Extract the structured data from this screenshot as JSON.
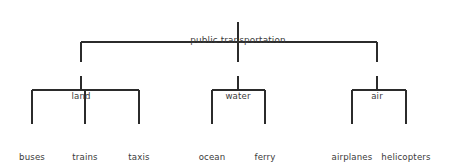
{
  "diagram": {
    "type": "tree",
    "title": "public transportation",
    "background_color": "#ffffff",
    "line_color": "#2b2b2b",
    "text_color": "#3a3a3a",
    "root": {
      "id": "public-transportation",
      "label": "public transportation",
      "x": 238,
      "y": 14
    },
    "level1": [
      {
        "id": "land",
        "label": "land",
        "x": 81,
        "y": 70
      },
      {
        "id": "water",
        "label": "water",
        "x": 238,
        "y": 70
      },
      {
        "id": "air",
        "label": "air",
        "x": 377,
        "y": 70
      }
    ],
    "leaves": [
      {
        "id": "buses",
        "parent": "land",
        "line1": "buses",
        "line2": "",
        "x": 32,
        "y": 131
      },
      {
        "id": "trains",
        "parent": "land",
        "line1": "trains",
        "line2": "",
        "x": 85,
        "y": 131
      },
      {
        "id": "taxis",
        "parent": "land",
        "line1": "taxis",
        "line2": "",
        "x": 139,
        "y": 131
      },
      {
        "id": "ocean-liners",
        "parent": "water",
        "line1": "ocean",
        "line2": "liners",
        "x": 212,
        "y": 131
      },
      {
        "id": "ferry-boats",
        "parent": "water",
        "line1": "ferry",
        "line2": "boats",
        "x": 265,
        "y": 131
      },
      {
        "id": "airplanes",
        "parent": "air",
        "line1": "airplanes",
        "line2": "",
        "x": 352,
        "y": 131
      },
      {
        "id": "helicopters",
        "parent": "air",
        "line1": "helicopters",
        "line2": "",
        "x": 406,
        "y": 131
      }
    ],
    "edges": {
      "root_stem": {
        "x": 238,
        "y1": 22,
        "y2": 42
      },
      "level1_bar": {
        "y": 42,
        "x1": 81,
        "x2": 377
      },
      "level1_stems": [
        {
          "x": 81,
          "y1": 42,
          "y2": 62
        },
        {
          "x": 238,
          "y1": 42,
          "y2": 62
        },
        {
          "x": 377,
          "y1": 42,
          "y2": 62
        }
      ],
      "level2_drops": [
        {
          "x": 81,
          "y1": 76,
          "y2": 90
        },
        {
          "x": 238,
          "y1": 76,
          "y2": 90
        },
        {
          "x": 377,
          "y1": 76,
          "y2": 90
        }
      ],
      "level2_bars": [
        {
          "y": 90,
          "x1": 32,
          "x2": 139
        },
        {
          "y": 90,
          "x1": 212,
          "x2": 265
        },
        {
          "y": 90,
          "x1": 352,
          "x2": 406
        }
      ],
      "leaf_stems": [
        {
          "x": 32,
          "y1": 90,
          "y2": 124
        },
        {
          "x": 85,
          "y1": 90,
          "y2": 124
        },
        {
          "x": 139,
          "y1": 90,
          "y2": 124
        },
        {
          "x": 212,
          "y1": 90,
          "y2": 124
        },
        {
          "x": 265,
          "y1": 90,
          "y2": 124
        },
        {
          "x": 352,
          "y1": 90,
          "y2": 124
        },
        {
          "x": 406,
          "y1": 90,
          "y2": 124
        }
      ]
    }
  }
}
